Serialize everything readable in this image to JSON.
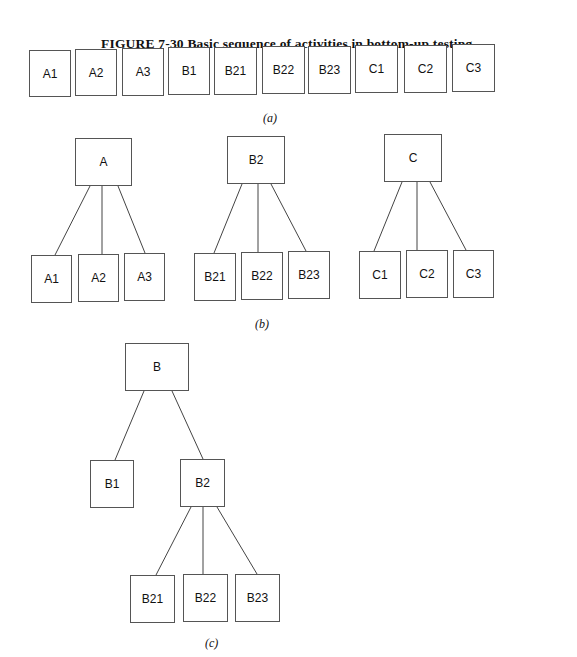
{
  "caption": "FIGURE 7-30  Basic sequence of activities in bottom-up testing.",
  "part_a": {
    "label": "(a)",
    "modules": [
      "A1",
      "A2",
      "A3",
      "B1",
      "B21",
      "B22",
      "B23",
      "C1",
      "C2",
      "C3"
    ]
  },
  "part_b": {
    "label": "(b)",
    "trees": [
      {
        "root": "A",
        "children": [
          "A1",
          "A2",
          "A3"
        ]
      },
      {
        "root": "B2",
        "children": [
          "B21",
          "B22",
          "B23"
        ]
      },
      {
        "root": "C",
        "children": [
          "C1",
          "C2",
          "C3"
        ]
      }
    ]
  },
  "part_c": {
    "label": "(c)",
    "root": "B",
    "children": [
      "B1",
      "B2"
    ],
    "b2_children": [
      "B21",
      "B22",
      "B23"
    ]
  }
}
